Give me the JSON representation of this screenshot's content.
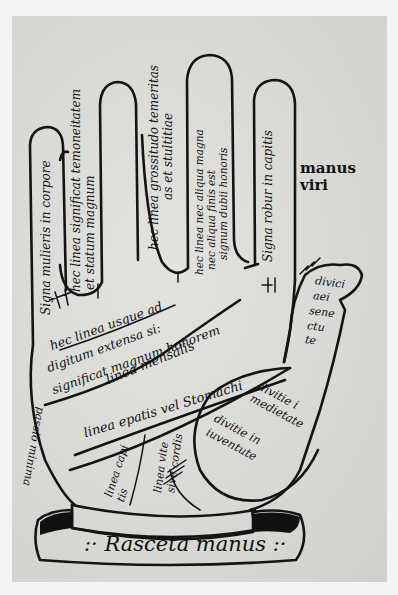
{
  "image": {
    "description": "Medieval manuscript palmistry diagram of a right hand with Latin inscriptions on the fingers and palm",
    "colors": {
      "paper": "#d9d9d6",
      "ink": "#141414",
      "margin": "#f4f4f2"
    }
  },
  "side_label": {
    "line1": "manus",
    "line2": "viri"
  },
  "fingers": {
    "little_finger": {
      "text": "Signa mulieris in corpore"
    },
    "ring_finger_outer": {
      "line1": "hec linea significat temoneitatem",
      "line2": "et statum magnum"
    },
    "middle_finger": {
      "line1": "hec linea grossitudo temeritas",
      "line2": "as et stultitiae"
    },
    "index_finger": {
      "line1": "hec linea nec aliqua magna",
      "line2": "nec aliqua finis est",
      "line3": "signum dubii honoris"
    },
    "index_finger_right": {
      "text": "Signa robur in capitis"
    },
    "thumb": {
      "line1": "divici",
      "line2": "aei",
      "line3": "sene",
      "line4": "ctu",
      "line5": "te"
    }
  },
  "palm": {
    "heart_line_caption": {
      "line1": "hec linea usque ad",
      "line2": "digitum extensa si:",
      "line3": "significat magnum honorem"
    },
    "table_line": "linea mensalis",
    "stomach_line": "linea epatis vel Stomachi",
    "head_line": {
      "line1": "linea capi",
      "line2": "tis"
    },
    "life_line": {
      "line1": "linea vite",
      "line2": "sive cordis"
    },
    "left_edge": "passio minima",
    "thenar_upper": {
      "line1": "divitie i",
      "line2": "medietate"
    },
    "thenar_lower": {
      "line1": "divitie in",
      "line2": "iuventute"
    }
  },
  "banner": {
    "text": ":· Rasceta manus :·"
  }
}
